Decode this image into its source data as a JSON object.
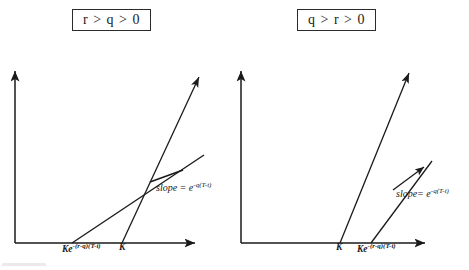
{
  "figure": {
    "kind": "two-panel line diagram",
    "panels": [
      {
        "id": "left",
        "title": "r > q > 0",
        "axis_labels": [
          {
            "name": "x-tick-left-1",
            "text_html": "Ke<sup>-(r-q)(T-t)</sup>",
            "x": 62,
            "y": 248
          },
          {
            "name": "x-tick-left-2",
            "text_html": "K",
            "x": 119,
            "y": 248
          }
        ],
        "annotation": {
          "name": "slope-annotation-left",
          "text_html": "slope = e<sup>-q(T-t)</sup>",
          "x": 156,
          "y": 186
        },
        "lines": [
          {
            "name": "shallow-payoff-line",
            "x1": 72,
            "y1": 243,
            "x2": 206,
            "y2": 154
          },
          {
            "name": "steep-payoff-line",
            "x1": 122,
            "y1": 243,
            "x2": 201,
            "y2": 74
          },
          {
            "name": "annotation-pointer",
            "x1": 150,
            "y1": 181,
            "x2": 184,
            "y2": 170
          }
        ],
        "axes": {
          "y_axis": {
            "x": 15,
            "y_top": 68,
            "y_bottom": 243
          },
          "x_axis": {
            "y": 243,
            "x_left": 15,
            "x_right": 198
          }
        }
      },
      {
        "id": "right",
        "title": "q > r > 0",
        "axis_labels": [
          {
            "name": "x-tick-right-1",
            "text_html": "K",
            "x": 337,
            "y": 248
          },
          {
            "name": "x-tick-right-2",
            "text_html": "Ke<sup>-(r-q)(T-t)</sup>",
            "x": 358,
            "y": 248
          }
        ],
        "annotation": {
          "name": "slope-annotation-right",
          "text_html": "slope= e<sup>-q(T-t)</sup>",
          "x": 396,
          "y": 191
        },
        "lines": [
          {
            "name": "steep-payoff-line",
            "x1": 340,
            "y1": 243,
            "x2": 411,
            "y2": 70
          },
          {
            "name": "shallow-payoff-line",
            "x1": 371,
            "y1": 243,
            "x2": 434,
            "y2": 160
          },
          {
            "name": "annotation-pointer",
            "x1": 391,
            "y1": 191,
            "x2": 425,
            "y2": 167
          }
        ],
        "axes": {
          "y_axis": {
            "x": 241,
            "y_top": 68,
            "y_bottom": 243
          },
          "x_axis": {
            "y": 243,
            "x_left": 241,
            "x_right": 428
          }
        }
      }
    ],
    "colors": {
      "ink": "#1a1a1a",
      "box_border": "#2b2b2b",
      "background": "#ffffff"
    }
  }
}
